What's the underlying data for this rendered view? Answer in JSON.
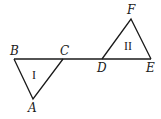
{
  "diagram": {
    "type": "geometry",
    "stroke_color": "#1a1a1a",
    "background": "#ffffff",
    "line": {
      "from": "B",
      "to": "E",
      "points_on_line": [
        "B",
        "C",
        "D",
        "E"
      ]
    },
    "points": {
      "A": {
        "label": "A",
        "x": 33,
        "y": 99
      },
      "B": {
        "label": "B",
        "x": 14,
        "y": 59
      },
      "C": {
        "label": "C",
        "x": 63,
        "y": 59
      },
      "D": {
        "label": "D",
        "x": 102,
        "y": 59
      },
      "E": {
        "label": "E",
        "x": 151,
        "y": 59
      },
      "F": {
        "label": "F",
        "x": 131,
        "y": 19
      }
    },
    "triangles": [
      {
        "name": "I",
        "label": "I",
        "vertices": [
          "A",
          "B",
          "C"
        ],
        "orientation": "pointing down"
      },
      {
        "name": "II",
        "label": "II",
        "vertices": [
          "D",
          "E",
          "F"
        ],
        "orientation": "pointing up"
      }
    ]
  }
}
